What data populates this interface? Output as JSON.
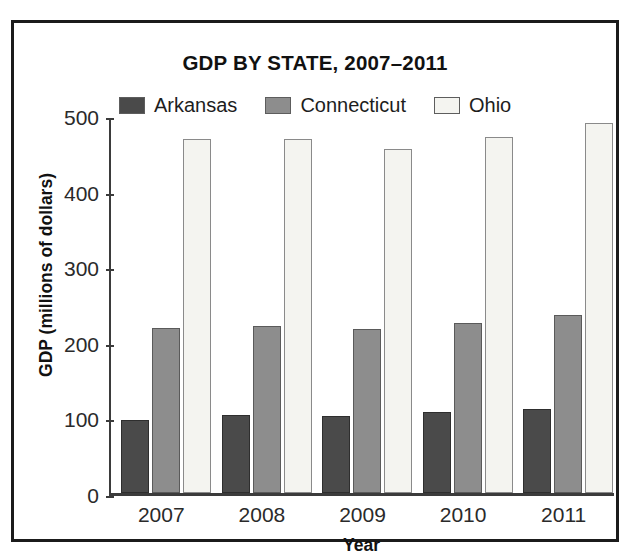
{
  "chart_data": {
    "type": "bar",
    "title": "GDP BY STATE, 2007–2011",
    "xlabel": "Year",
    "ylabel": "GDP (millions of dollars)",
    "categories": [
      "2007",
      "2008",
      "2009",
      "2010",
      "2011"
    ],
    "series": [
      {
        "name": "Arkansas",
        "color": "#4a4a4a",
        "values": [
          97,
          103,
          102,
          107,
          111
        ]
      },
      {
        "name": "Connecticut",
        "color": "#8d8d8d",
        "values": [
          218,
          221,
          217,
          225,
          236
        ]
      },
      {
        "name": "Ohio",
        "color": "#f4f4f0",
        "values": [
          468,
          468,
          455,
          471,
          489
        ]
      }
    ],
    "ylim": [
      0,
      500
    ],
    "yticks": [
      0,
      100,
      200,
      300,
      400,
      500
    ],
    "ytick_labels": [
      "0",
      "100",
      "200",
      "300",
      "400",
      "500"
    ],
    "grid": false,
    "legend_position": "top-center",
    "orientation": "vertical",
    "bar_grouping": "clustered"
  },
  "legend": {
    "items": [
      {
        "label": "Arkansas",
        "swatch": "dark-gray-swatch"
      },
      {
        "label": "Connecticut",
        "swatch": "medium-gray-swatch"
      },
      {
        "label": "Ohio",
        "swatch": "white-swatch"
      }
    ]
  },
  "colors": {
    "arkansas": "#4a4a4a",
    "connecticut": "#8d8d8d",
    "ohio": "#f4f4f0",
    "frame": "#1b1b1b",
    "axis": "#3b3b3b",
    "text": "#111111",
    "background": "#ffffff"
  }
}
